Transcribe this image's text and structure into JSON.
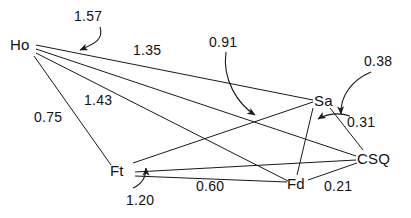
{
  "diagram": {
    "type": "path-diagram",
    "title": "",
    "nodes": [
      {
        "id": "Ho",
        "label": "Ho",
        "x": 10,
        "y": 36
      },
      {
        "id": "Sa",
        "label": "Sa",
        "x": 314,
        "y": 92
      },
      {
        "id": "Ft",
        "label": "Ft",
        "x": 110,
        "y": 162
      },
      {
        "id": "Fd",
        "label": "Fd",
        "x": 287,
        "y": 175
      },
      {
        "id": "CSQ",
        "label": "CSQ",
        "x": 357,
        "y": 150
      }
    ],
    "edges": [
      {
        "id": "e1",
        "from": "Ho",
        "to": "Sa",
        "value": "1.57",
        "label_x": 74,
        "label_y": 8
      },
      {
        "id": "e2",
        "from": "Ho",
        "to": "CSQ",
        "value": "1.35",
        "label_x": 133,
        "label_y": 42
      },
      {
        "id": "e3",
        "from": "Ho",
        "to": "Fd",
        "value": "1.43",
        "label_x": 84,
        "label_y": 92
      },
      {
        "id": "e4",
        "from": "Ho",
        "to": "Ft",
        "value": "0.75",
        "label_x": 34,
        "label_y": 109
      },
      {
        "id": "e5",
        "from": "Ft",
        "to": "Sa",
        "value": "0.91",
        "label_x": 209,
        "label_y": 34
      },
      {
        "id": "e6",
        "from": "Sa",
        "to": "CSQ",
        "value": "0.38",
        "label_x": 364,
        "label_y": 53
      },
      {
        "id": "e7",
        "from": "CSQ",
        "to": "Sa",
        "value": "0.31",
        "label_x": 347,
        "label_y": 114
      },
      {
        "id": "e8",
        "from": "Ft",
        "to": "Fd",
        "value": "0.60",
        "label_x": 196,
        "label_y": 178
      },
      {
        "id": "e9",
        "from": "Ft",
        "to": "CSQ",
        "value": "1.20",
        "label_x": 126,
        "label_y": 192
      },
      {
        "id": "e10",
        "from": "Fd",
        "to": "CSQ",
        "value": "0.21",
        "label_x": 324,
        "label_y": 178
      }
    ],
    "colors": {
      "line": "#1a1a1a",
      "text": "#111111",
      "background": "#ffffff"
    }
  }
}
